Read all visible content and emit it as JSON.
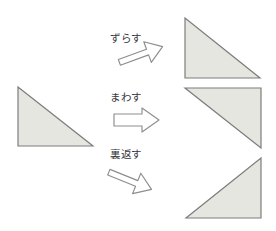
{
  "figure": {
    "background_color": "#ffffff",
    "shape_fill_color": "#e6e6e1",
    "shape_stroke_color": "#7d7d7d",
    "arrow_stroke_color": "#8a8a8a",
    "arrow_fill_color": "#ffffff",
    "label_text_color": "#35353a"
  },
  "source_shape": {
    "name": "original-triangle",
    "right_angle_corner": "bottom-left",
    "points": "18,87 18,146 93,146"
  },
  "operations": [
    {
      "id": "shift",
      "label": "ずらす",
      "romaji": "zurasu",
      "meaning": "shift / slide",
      "arrow_direction": "up-right",
      "result_right_angle_corner": "bottom-left"
    },
    {
      "id": "rotate",
      "label": "まわす",
      "romaji": "mawasu",
      "meaning": "rotate / turn",
      "arrow_direction": "right",
      "result_right_angle_corner": "top-right"
    },
    {
      "id": "flip",
      "label": "裏返す",
      "romaji": "uragaesu",
      "meaning": "flip over / reverse",
      "arrow_direction": "down-right",
      "result_right_angle_corner": "bottom-right"
    }
  ],
  "result_shapes": [
    {
      "name": "result-triangle-shift",
      "right_angle_corner": "bottom-left",
      "points": "185,18 185,78 260,78"
    },
    {
      "name": "result-triangle-rotate",
      "right_angle_corner": "top-right",
      "points": "185,88 261,88 261,148"
    },
    {
      "name": "result-triangle-flip",
      "right_angle_corner": "bottom-right",
      "points": "261,158 261,218 186,218"
    }
  ]
}
